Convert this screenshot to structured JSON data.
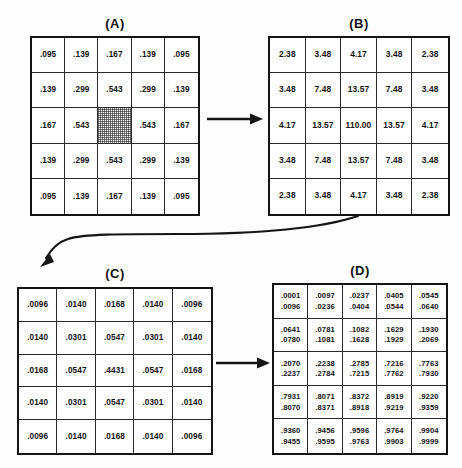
{
  "figure": {
    "panels": [
      {
        "id": "A",
        "label": "(A)",
        "name": "panel-a",
        "value_lines": 1,
        "shaded_cell": {
          "row": 2,
          "col": 2
        },
        "rows": [
          [
            ".095",
            ".139",
            ".167",
            ".139",
            ".095"
          ],
          [
            ".139",
            ".299",
            ".543",
            ".299",
            ".139"
          ],
          [
            ".167",
            ".543",
            "",
            ".543",
            ".167"
          ],
          [
            ".139",
            ".299",
            ".543",
            ".299",
            ".139"
          ],
          [
            ".095",
            ".139",
            ".167",
            ".139",
            ".095"
          ]
        ]
      },
      {
        "id": "B",
        "label": "(B)",
        "name": "panel-b",
        "value_lines": 1,
        "rows": [
          [
            "2.38",
            "3.48",
            "4.17",
            "3.48",
            "2.38"
          ],
          [
            "3.48",
            "7.48",
            "13.57",
            "7.48",
            "3.48"
          ],
          [
            "4.17",
            "13.57",
            "110.00",
            "13.57",
            "4.17"
          ],
          [
            "3.48",
            "7.48",
            "13.57",
            "7.48",
            "3.48"
          ],
          [
            "2.38",
            "3.48",
            "4.17",
            "3.48",
            "2.38"
          ]
        ]
      },
      {
        "id": "C",
        "label": "(C)",
        "name": "panel-c",
        "value_lines": 1,
        "rows": [
          [
            ".0096",
            ".0140",
            ".0168",
            ".0140",
            ".0096"
          ],
          [
            ".0140",
            ".0301",
            ".0547",
            ".0301",
            ".0140"
          ],
          [
            ".0168",
            ".0547",
            ".4431",
            ".0547",
            ".0168"
          ],
          [
            ".0140",
            ".0301",
            ".0547",
            ".0301",
            ".0140"
          ],
          [
            ".0096",
            ".0140",
            ".0168",
            ".0140",
            ".0096"
          ]
        ]
      },
      {
        "id": "D",
        "label": "(D)",
        "name": "panel-d",
        "value_lines": 2,
        "rows": [
          [
            {
              "upper": ".0001",
              "lower": ".0096"
            },
            {
              "upper": ".0097",
              "lower": ".0236"
            },
            {
              "upper": ".0237",
              "lower": ".0404"
            },
            {
              "upper": ".0405",
              "lower": ".0544"
            },
            {
              "upper": ".0545",
              "lower": ".0640"
            }
          ],
          [
            {
              "upper": ".0641",
              "lower": ".0780"
            },
            {
              "upper": ".0781",
              "lower": ".1081"
            },
            {
              "upper": ".1082",
              "lower": ".1628"
            },
            {
              "upper": ".1629",
              "lower": ".1929"
            },
            {
              "upper": ".1930",
              "lower": ".2069"
            }
          ],
          [
            {
              "upper": ".2070",
              "lower": ".2237"
            },
            {
              "upper": ".2238",
              "lower": ".2784"
            },
            {
              "upper": ".2785",
              "lower": ".7215"
            },
            {
              "upper": ".7216",
              "lower": ".7762"
            },
            {
              "upper": ".7763",
              "lower": ".7930"
            }
          ],
          [
            {
              "upper": ".7931",
              "lower": ".8070"
            },
            {
              "upper": ".8071",
              "lower": ".8371"
            },
            {
              "upper": ".8372",
              "lower": ".8918"
            },
            {
              "upper": ".8919",
              "lower": ".9219"
            },
            {
              "upper": ".9220",
              "lower": ".9359"
            }
          ],
          [
            {
              "upper": ".9360",
              "lower": ".9455"
            },
            {
              "upper": ".9456",
              "lower": ".9595"
            },
            {
              "upper": ".9596",
              "lower": ".9763"
            },
            {
              "upper": ".9764",
              "lower": ".9903"
            },
            {
              "upper": ".9904",
              "lower": ".9999"
            }
          ]
        ]
      }
    ],
    "arrows": [
      {
        "name": "arrow-a-to-b",
        "from": "A",
        "to": "B",
        "style": "straight-right"
      },
      {
        "name": "arrow-b-to-c",
        "from": "B",
        "to": "C",
        "style": "curved-left"
      },
      {
        "name": "arrow-c-to-d",
        "from": "C",
        "to": "D",
        "style": "straight-right"
      }
    ],
    "colors": {
      "ink": "#151515",
      "paper": "#fdfdfd",
      "grid_line": "#2a2a2a"
    }
  }
}
